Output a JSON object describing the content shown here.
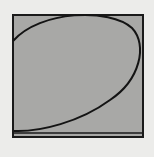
{
  "diagram": {
    "background": "#ececea",
    "square": {
      "x": 13,
      "y": 15,
      "width": 130,
      "height": 122,
      "fill": "#a8a8a6",
      "stroke": "#1a1a1a",
      "stroke_width": 2
    },
    "bottom_band": {
      "y": 133,
      "stroke": "#1a1a1a"
    },
    "curve": {
      "d": "M13 41 C 40 10, 110 8, 132 28 C 148 45, 140 80, 110 100 C 80 122, 40 132, 14 131",
      "stroke": "#141414",
      "stroke_width": 2
    }
  }
}
